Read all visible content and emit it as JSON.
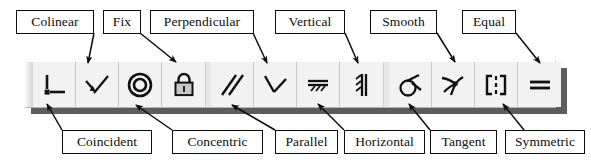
{
  "diagram": {
    "ink_color": "#0d0d0d",
    "toolbar_face_color": "#f2f2f2",
    "toolbar_shadow_color": "#5d5d5d"
  },
  "toolbar": {
    "name": "constraints-toolbar",
    "groups": [
      {
        "name": "group-1",
        "buttons": [
          {
            "id": "coincident",
            "icon": "coincident-icon",
            "label": "Coincident"
          },
          {
            "id": "colinear",
            "icon": "colinear-icon",
            "label": "Colinear"
          },
          {
            "id": "concentric",
            "icon": "concentric-icon",
            "label": "Concentric"
          },
          {
            "id": "fix",
            "icon": "fix-lock-icon",
            "label": "Fix"
          }
        ]
      },
      {
        "name": "group-2",
        "buttons": [
          {
            "id": "parallel",
            "icon": "parallel-icon",
            "label": "Parallel"
          },
          {
            "id": "perpendicular",
            "icon": "perpendicular-icon",
            "label": "Perpendicular"
          },
          {
            "id": "horizontal",
            "icon": "horizontal-icon",
            "label": "Horizontal"
          },
          {
            "id": "vertical",
            "icon": "vertical-icon",
            "label": "Vertical"
          }
        ]
      },
      {
        "name": "group-3",
        "buttons": [
          {
            "id": "tangent",
            "icon": "tangent-icon",
            "label": "Tangent"
          },
          {
            "id": "smooth",
            "icon": "smooth-icon",
            "label": "Smooth"
          },
          {
            "id": "symmetric",
            "icon": "symmetric-icon",
            "label": "Symmetric"
          },
          {
            "id": "equal",
            "icon": "equal-icon",
            "label": "Equal"
          }
        ]
      }
    ]
  },
  "callouts": {
    "top": [
      {
        "id": "colinear",
        "text": "Colinear"
      },
      {
        "id": "fix",
        "text": "Fix"
      },
      {
        "id": "perpendicular",
        "text": "Perpendicular"
      },
      {
        "id": "vertical",
        "text": "Vertical"
      },
      {
        "id": "smooth",
        "text": "Smooth"
      },
      {
        "id": "equal",
        "text": "Equal"
      }
    ],
    "bottom": [
      {
        "id": "coincident",
        "text": "Coincident"
      },
      {
        "id": "concentric",
        "text": "Concentric"
      },
      {
        "id": "parallel",
        "text": "Parallel"
      },
      {
        "id": "horizontal",
        "text": "Horizontal"
      },
      {
        "id": "tangent",
        "text": "Tangent"
      },
      {
        "id": "symmetric",
        "text": "Symmetric"
      }
    ]
  }
}
